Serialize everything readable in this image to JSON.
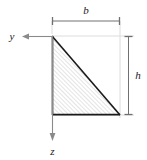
{
  "figure": {
    "type": "cross-section-diagram",
    "background_color": "#ffffff",
    "outline_color": "#1a1a1a",
    "hatch_color": "#c9c9c9",
    "dimension_color": "#6e6e6e",
    "extension_color": "#d8d8d8",
    "axis_color": "#8a8a8a"
  },
  "shape": {
    "name": "right-triangle",
    "vertices": [
      {
        "x": 52,
        "y": 36
      },
      {
        "x": 52,
        "y": 115
      },
      {
        "x": 120,
        "y": 115
      }
    ],
    "hatch_angle_deg": 45,
    "hatch_spacing_px": 3
  },
  "dimensions": [
    {
      "id": "width",
      "label": "b",
      "orientation": "horizontal",
      "label_x": 86,
      "label_y": 14,
      "line_y": 21,
      "from_x": 52,
      "to_x": 120,
      "tick_half_length": 4
    },
    {
      "id": "height",
      "label": "h",
      "orientation": "vertical",
      "label_x": 137,
      "label_y": 79,
      "line_x": 128,
      "from_y": 36,
      "to_y": 115,
      "tick_half_length": 4
    }
  ],
  "axes": [
    {
      "id": "y-axis",
      "label": "y",
      "direction": "left",
      "origin_x": 52,
      "origin_y": 36,
      "tip_x": 22,
      "tip_y": 36,
      "label_x": 12,
      "label_y": 40
    },
    {
      "id": "z-axis",
      "label": "z",
      "direction": "down",
      "origin_x": 52,
      "origin_y": 36,
      "tip_x": 52,
      "tip_y": 140,
      "label_x": 52,
      "label_y": 154
    }
  ],
  "extension_lines": [
    {
      "id": "top-extension",
      "x1": 52,
      "y1": 36,
      "x2": 134,
      "y2": 36
    },
    {
      "id": "bottom-extension",
      "x1": 52,
      "y1": 115,
      "x2": 134,
      "y2": 115
    },
    {
      "id": "right-extension",
      "x1": 120,
      "y1": 21,
      "x2": 120,
      "y2": 118
    },
    {
      "id": "left-extension",
      "x1": 52,
      "y1": 21,
      "x2": 52,
      "y2": 36
    }
  ]
}
